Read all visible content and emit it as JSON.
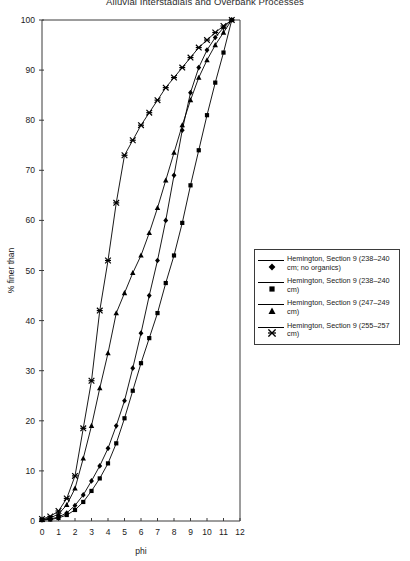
{
  "chart_data": {
    "type": "line",
    "title": "Alluvial Interstadials and Overbank Processes",
    "xlabel": "phi",
    "ylabel": "% finer than",
    "xlim": [
      0,
      12
    ],
    "ylim": [
      0,
      100
    ],
    "xticks": [
      0,
      1,
      2,
      3,
      4,
      5,
      6,
      7,
      8,
      9,
      10,
      11,
      12
    ],
    "yticks": [
      0,
      10,
      20,
      30,
      40,
      50,
      60,
      70,
      80,
      90,
      100
    ],
    "grid": false,
    "legend_position": "right",
    "series": [
      {
        "name": "Hemington, Section 9 (238–240 cm; no organics)",
        "marker": "diamond",
        "x": [
          0,
          0.5,
          1,
          1.5,
          2,
          2.5,
          3,
          3.5,
          4,
          4.5,
          5,
          5.5,
          6,
          6.5,
          7,
          7.5,
          8,
          8.5,
          9,
          9.5,
          10,
          10.5,
          11,
          11.5
        ],
        "y": [
          0.2,
          0.4,
          0.8,
          1.6,
          3.1,
          5.2,
          8.0,
          11.0,
          14.5,
          19.0,
          24.0,
          30.5,
          37.5,
          45.0,
          52.0,
          60.0,
          69.0,
          78.0,
          85.5,
          90.5,
          94.0,
          96.5,
          98.5,
          100.0
        ]
      },
      {
        "name": "Hemington, Section 9 (238–240 cm)",
        "marker": "square",
        "x": [
          0,
          0.5,
          1,
          1.5,
          2,
          2.5,
          3,
          3.5,
          4,
          4.5,
          5,
          5.5,
          6,
          6.5,
          7,
          7.5,
          8,
          8.5,
          9,
          9.5,
          10,
          10.5,
          11,
          11.5
        ],
        "y": [
          0.2,
          0.3,
          0.6,
          1.2,
          2.2,
          3.8,
          6.0,
          8.5,
          11.5,
          15.5,
          20.5,
          26.0,
          31.5,
          36.5,
          41.5,
          47.5,
          53.0,
          59.5,
          67.0,
          74.0,
          81.0,
          87.5,
          93.5,
          100.0
        ]
      },
      {
        "name": "Hemington, Section 9 (247–249 cm)",
        "marker": "triangle",
        "x": [
          0,
          0.5,
          1,
          1.5,
          2,
          2.5,
          3,
          3.5,
          4,
          4.5,
          5,
          5.5,
          6,
          6.5,
          7,
          7.5,
          8,
          8.5,
          9,
          9.5,
          10,
          10.5,
          11,
          11.5
        ],
        "y": [
          0.3,
          0.6,
          1.4,
          3.2,
          6.5,
          12.5,
          19.0,
          26.5,
          33.5,
          41.5,
          45.5,
          49.5,
          53.0,
          57.5,
          62.5,
          68.0,
          73.5,
          79.0,
          84.0,
          88.5,
          92.0,
          95.0,
          97.5,
          100.0
        ]
      },
      {
        "name": "Hemington, Section 9 (255–257 cm)",
        "marker": "cross",
        "x": [
          0,
          0.5,
          1,
          1.5,
          2,
          2.5,
          3,
          3.5,
          4,
          4.5,
          5,
          5.5,
          6,
          6.5,
          7,
          7.5,
          8,
          8.5,
          9,
          9.5,
          10,
          10.5,
          11,
          11.5
        ],
        "y": [
          0.4,
          0.9,
          2.0,
          4.5,
          9.0,
          18.5,
          28.0,
          42.0,
          52.0,
          63.5,
          73.0,
          76.0,
          79.0,
          81.5,
          84.0,
          86.5,
          88.5,
          90.5,
          92.5,
          94.5,
          96.0,
          97.5,
          98.8,
          100.0
        ]
      }
    ]
  },
  "legend": {
    "items": [
      {
        "label": "Hemington, Section 9 (238–240 cm; no organics)",
        "marker": "diamond"
      },
      {
        "label": "Hemington, Section 9 (238–240 cm)",
        "marker": "square"
      },
      {
        "label": "Hemington, Section 9 (247–249 cm)",
        "marker": "triangle"
      },
      {
        "label": "Hemington, Section 9 (255–257 cm)",
        "marker": "cross"
      }
    ]
  },
  "colors": {
    "line": "#000000",
    "axis": "#3b3b3b",
    "text": "#1a1a1a",
    "background": "#ffffff"
  }
}
